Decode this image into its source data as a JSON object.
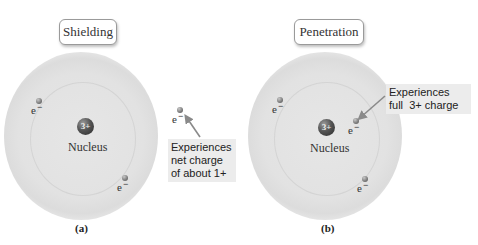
{
  "diagram": {
    "panels": [
      {
        "id": "a",
        "title": "Shielding",
        "nucleus": {
          "charge": "3+",
          "label": "Nucleus"
        },
        "electrons": [
          {
            "symbol": "e",
            "superscript": "−"
          },
          {
            "symbol": "e",
            "superscript": "−"
          },
          {
            "symbol": "e",
            "superscript": "−"
          }
        ],
        "callout": {
          "lines": [
            "Experiences",
            "net charge",
            "of about 1+"
          ]
        },
        "caption": "(a)"
      },
      {
        "id": "b",
        "title": "Penetration",
        "nucleus": {
          "charge": "3+",
          "label": "Nucleus"
        },
        "electrons": [
          {
            "symbol": "e",
            "superscript": "−"
          },
          {
            "symbol": "e",
            "superscript": "−"
          },
          {
            "symbol": "e",
            "superscript": "−"
          }
        ],
        "callout": {
          "lines": [
            "Experiences",
            "full  3+ charge"
          ]
        },
        "caption": "(b)"
      }
    ],
    "colors": {
      "cloud": "#dedede",
      "callout_bg": "#ececec",
      "arrow": "#8a8a8a",
      "nucleus": "#3a3a3a"
    }
  }
}
